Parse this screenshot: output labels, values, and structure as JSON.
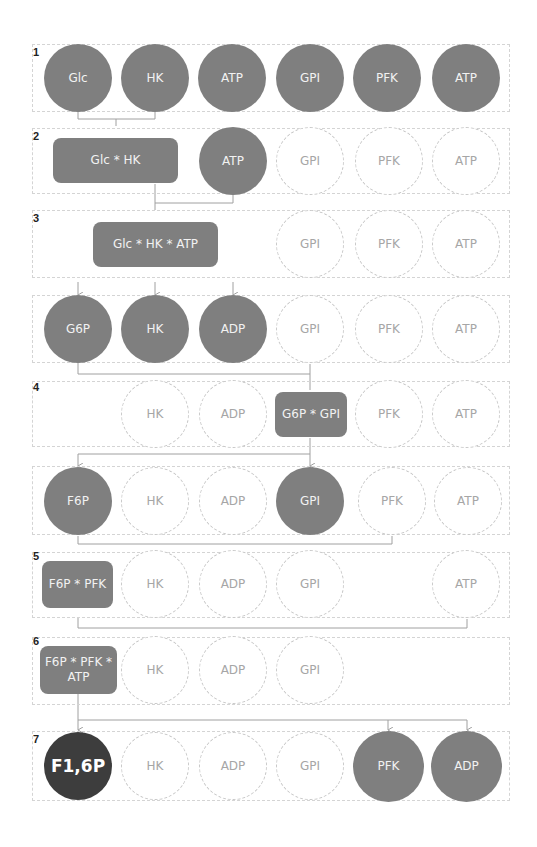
{
  "diagram": {
    "colors": {
      "filled": "#7f7f7f",
      "product": "#3d3d3d",
      "empty_border": "#c8c8c8",
      "empty_text": "#a6a6a6",
      "connector": "#a0a0a0"
    },
    "steps": [
      {
        "label": "1",
        "nodes": [
          "Glc",
          "HK",
          "ATP",
          "GPI",
          "PFK",
          "ATP"
        ]
      },
      {
        "label": "2",
        "nodes": [
          "Glc * HK",
          "ATP",
          "GPI",
          "PFK",
          "ATP"
        ]
      },
      {
        "label": "3",
        "nodes": [
          "Glc * HK * ATP",
          "GPI",
          "PFK",
          "ATP"
        ]
      },
      {
        "label": "",
        "nodes": [
          "G6P",
          "HK",
          "ADP",
          "GPI",
          "PFK",
          "ATP"
        ]
      },
      {
        "label": "4",
        "nodes": [
          "HK",
          "ADP",
          "G6P * GPI",
          "PFK",
          "ATP"
        ]
      },
      {
        "label": "",
        "nodes": [
          "F6P",
          "HK",
          "ADP",
          "GPI",
          "PFK",
          "ATP"
        ]
      },
      {
        "label": "5",
        "nodes": [
          "F6P * PFK",
          "HK",
          "ADP",
          "GPI",
          "ATP"
        ]
      },
      {
        "label": "6",
        "nodes": [
          "F6P * PFK * ATP",
          "HK",
          "ADP",
          "GPI"
        ]
      },
      {
        "label": "7",
        "nodes": [
          "F1,6P",
          "HK",
          "ADP",
          "GPI",
          "PFK",
          "ADP"
        ]
      }
    ]
  }
}
